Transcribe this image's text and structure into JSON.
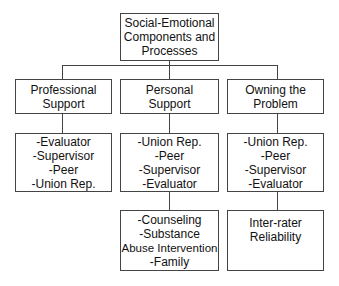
{
  "root": {
    "lines": [
      "Social-Emotional",
      "Components and",
      "Processes"
    ]
  },
  "columns": [
    {
      "header": [
        "Professional",
        "Support"
      ],
      "roles": [
        "-Evaluator",
        "-Supervisor",
        "-Peer",
        "-Union Rep."
      ]
    },
    {
      "header": [
        "Personal",
        "Support"
      ],
      "roles": [
        "-Union Rep.",
        "-Peer",
        "-Supervisor",
        "-Evaluator"
      ],
      "detail": [
        "-Counseling",
        "-Substance",
        "Abuse Intervention",
        "-Family"
      ]
    },
    {
      "header": [
        "Owning the",
        "Problem"
      ],
      "roles": [
        "-Union Rep.",
        "-Peer",
        "-Supervisor",
        "-Evaluator"
      ],
      "detail": [
        "Inter-rater",
        "Reliability"
      ]
    }
  ]
}
